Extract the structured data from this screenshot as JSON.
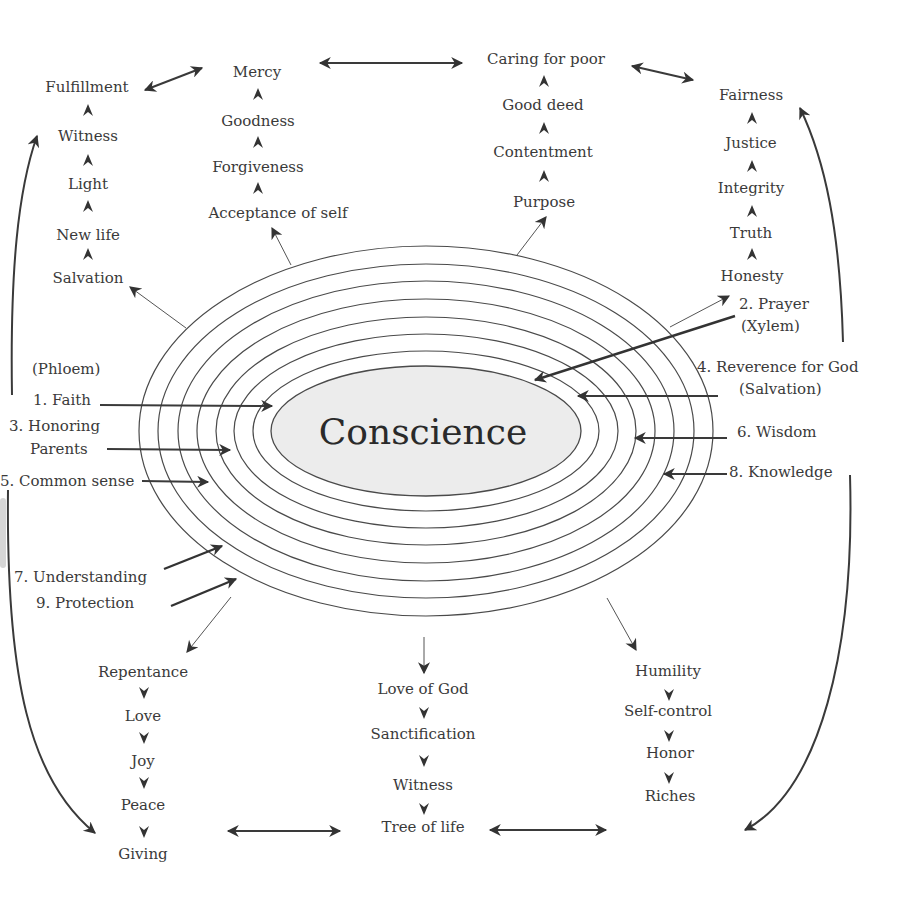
{
  "diagram": {
    "center_label": "Conscience",
    "colors": {
      "text": "#3a3a3a",
      "line": "#333333",
      "core_fill": "#ececec",
      "background": "#ffffff"
    },
    "left_upward_chain": {
      "items": [
        "Salvation",
        "New life",
        "Light",
        "Witness",
        "Fulfillment"
      ]
    },
    "mercy_chain": {
      "items": [
        "Acceptance of self",
        "Forgiveness",
        "Goodness",
        "Mercy"
      ]
    },
    "caring_chain": {
      "items": [
        "Purpose",
        "Contentment",
        "Good deed",
        "Caring for poor"
      ]
    },
    "fairness_chain": {
      "items": [
        "Honesty",
        "Truth",
        "Integrity",
        "Justice",
        "Fairness"
      ]
    },
    "repentance_chain": {
      "items": [
        "Repentance",
        "Love",
        "Joy",
        "Peace",
        "Giving"
      ]
    },
    "love_of_god_chain": {
      "items": [
        "Love of God",
        "Sanctification",
        "Witness",
        "Tree of life"
      ]
    },
    "humility_chain": {
      "items": [
        "Humility",
        "Self-control",
        "Honor",
        "Riches"
      ]
    },
    "inputs_left": {
      "phloem": "(Phloem)",
      "faith": "1. Faith",
      "honoring_1": "3. Honoring",
      "honoring_2": "Parents",
      "common_sense": "5. Common sense",
      "understanding": "7. Understanding",
      "protection": "9. Protection"
    },
    "inputs_right": {
      "prayer_1": "2. Prayer",
      "prayer_2": "(Xylem)",
      "reverence_1": "4. Reverence for God",
      "reverence_2": "(Salvation)",
      "wisdom": "6. Wisdom",
      "knowledge": "8. Knowledge"
    },
    "ring_count": 7
  }
}
